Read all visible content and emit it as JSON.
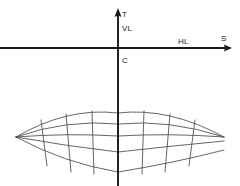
{
  "figure": {
    "background_color": "#ffffff",
    "axis_color": "#1a1a1a",
    "grid_color": "#4a4a4a",
    "labels": {
      "t_axis": "T",
      "vertical_line": "VL",
      "horizon_line": "HL",
      "station_axis": "S",
      "center": "C"
    },
    "label_positions": {
      "t_axis": {
        "x": 122,
        "y": 17
      },
      "vertical_line": {
        "x": 122,
        "y": 31
      },
      "horizon_line": {
        "x": 178,
        "y": 44
      },
      "station_axis": {
        "x": 222,
        "y": 41
      },
      "center": {
        "x": 122,
        "y": 62
      }
    },
    "axes": {
      "horizontal": {
        "x1": 0,
        "y1": 48,
        "x2": 232,
        "y2": 48,
        "arrow": "right"
      },
      "vertical": {
        "x1": 118,
        "y1": 10,
        "x2": 118,
        "y2": 186,
        "arrow": "up"
      }
    },
    "grid": {
      "type": "curved-perspective-mesh",
      "rows": 4,
      "columns": 8,
      "center_x": 118,
      "left_vertex": {
        "x": 16,
        "y": 137
      },
      "right_vertex": {
        "x": 224,
        "y": 137
      },
      "arc_center_y": [
        113,
        124,
        136,
        152,
        172
      ],
      "arc_edge_y": [
        137,
        137,
        137,
        141,
        150
      ],
      "arc_sag": [
        24,
        13,
        1,
        11,
        22
      ],
      "radial_x_at_top_arc": [
        41,
        66,
        92,
        118,
        144,
        170,
        195
      ],
      "radial_x_at_bottom_arc": [
        47,
        71,
        94,
        118,
        142,
        165,
        189
      ]
    }
  }
}
